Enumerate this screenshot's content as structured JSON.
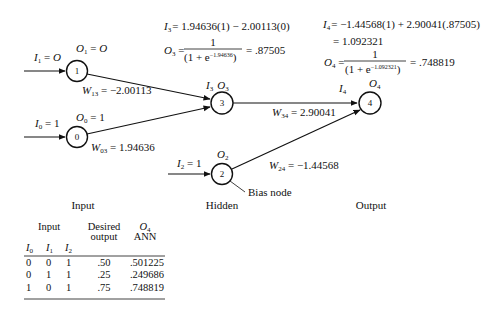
{
  "nodes": [
    {
      "id": "1",
      "layer": "input",
      "label_num": "1",
      "output_label": "O",
      "output_sub": "1",
      "output_value": "O",
      "input_label": "I",
      "input_sub": "1",
      "input_value": "O"
    },
    {
      "id": "0",
      "layer": "input",
      "label_num": "0",
      "output_label": "O",
      "output_sub": "0",
      "output_value": "1",
      "input_label": "I",
      "input_sub": "0",
      "input_value": "1"
    },
    {
      "id": "3",
      "layer": "hidden",
      "label_num": "3",
      "input_label": "I",
      "input_sub": "3",
      "output_label": "O",
      "output_sub": "3"
    },
    {
      "id": "2",
      "layer": "hidden",
      "label_num": "2",
      "output_label": "O",
      "output_sub": "2",
      "input_label": "I",
      "input_sub": "2",
      "input_value": "1",
      "note": "Bias node"
    },
    {
      "id": "4",
      "layer": "output",
      "label_num": "4",
      "input_label": "I",
      "input_sub": "4",
      "output_label": "O",
      "output_sub": "4"
    }
  ],
  "edges": [
    {
      "from": "1",
      "to": "3",
      "weight_label": "W",
      "weight_sub": "13",
      "weight_value": "−2.00113"
    },
    {
      "from": "0",
      "to": "3",
      "weight_label": "W",
      "weight_sub": "03",
      "weight_value": "1.94636"
    },
    {
      "from": "3",
      "to": "4",
      "weight_label": "W",
      "weight_sub": "34",
      "weight_value": "2.90041"
    },
    {
      "from": "2",
      "to": "4",
      "weight_label": "W",
      "weight_sub": "24",
      "weight_value": "−1.44568"
    }
  ],
  "equations": {
    "hidden": {
      "i3_lhs": "I",
      "i3_sub": "3",
      "i3_rhs": "= 1.94636(1) − 2.00113(0)",
      "o3_lhs": "O",
      "o3_sub": "3",
      "o3_numerator": "1",
      "o3_denominator_pre": "(1 + e",
      "o3_exponent": "−1.94636",
      "o3_denominator_post": ")",
      "o3_result": "= .87505"
    },
    "output": {
      "i4_lhs": "I",
      "i4_sub": "4",
      "i4_rhs": "= −1.44568(1) + 2.90041(.87505)",
      "i4_line2": "= 1.092321",
      "o4_lhs": "O",
      "o4_sub": "4",
      "o4_numerator": "1",
      "o4_denominator_pre": "(1 + e",
      "o4_exponent": "−1.092321",
      "o4_denominator_post": ")",
      "o4_result": "= .748819"
    }
  },
  "layer_labels": {
    "input": "Input",
    "hidden": "Hidden",
    "output": "Output"
  },
  "table": {
    "group_header_input": "Input",
    "header_desired_line1": "Desired",
    "header_desired_line2": "output",
    "header_o4_label": "O",
    "header_o4_sub": "4",
    "header_ann": "ANN",
    "subheaders": [
      {
        "label": "I",
        "sub": "0"
      },
      {
        "label": "I",
        "sub": "1"
      },
      {
        "label": "I",
        "sub": "2"
      }
    ],
    "rows": [
      {
        "i0": "0",
        "i1": "0",
        "i2": "1",
        "desired": ".50",
        "ann": ".501225"
      },
      {
        "i0": "0",
        "i1": "1",
        "i2": "1",
        "desired": ".25",
        "ann": ".249686"
      },
      {
        "i0": "1",
        "i1": "0",
        "i2": "1",
        "desired": ".75",
        "ann": ".748819"
      }
    ]
  }
}
